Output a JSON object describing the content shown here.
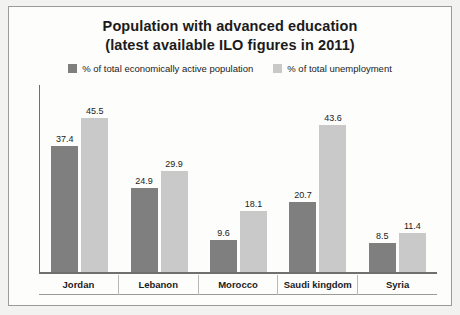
{
  "chart_data": {
    "type": "bar",
    "title": "Population with advanced education",
    "subtitle": "(latest available ILO figures in 2011)",
    "categories": [
      "Jordan",
      "Lebanon",
      "Morocco",
      "Saudi kingdom",
      "Syria"
    ],
    "series": [
      {
        "name": "% of total economically active population",
        "color": "#7f7f7f",
        "values": [
          37.4,
          24.9,
          9.6,
          20.7,
          8.5
        ]
      },
      {
        "name": "% of total unemployment",
        "color": "#c9c9c9",
        "values": [
          45.5,
          29.9,
          18.1,
          43.6,
          11.4
        ]
      }
    ],
    "xlabel": "",
    "ylabel": "",
    "ylim": [
      0,
      50
    ],
    "grid": false,
    "legend_position": "top"
  }
}
